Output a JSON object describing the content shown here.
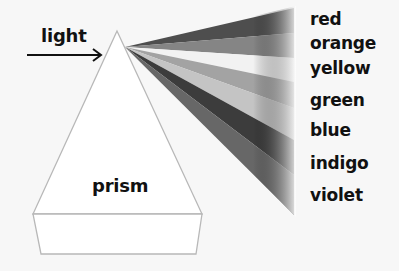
{
  "diagram": {
    "input_label": "light",
    "object_label": "prism",
    "colors": [
      {
        "name": "red",
        "label_y": 11,
        "shade": "#5a5a5a"
      },
      {
        "name": "orange",
        "label_y": 33,
        "shade": "#8a8a8a"
      },
      {
        "name": "yellow",
        "label_y": 58,
        "shade": "#f4f4f4"
      },
      {
        "name": "green",
        "label_y": 90,
        "shade": "#a6a6a6"
      },
      {
        "name": "blue",
        "label_y": 121,
        "shade": "#c8c8c8"
      },
      {
        "name": "indigo",
        "label_y": 155,
        "shade": "#4a4a4a"
      },
      {
        "name": "violet",
        "label_y": 189,
        "shade": "#6e6e6e"
      }
    ]
  }
}
